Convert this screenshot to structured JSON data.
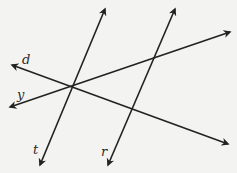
{
  "diagram": {
    "stroke_color": "#222222",
    "background_color": "#f3f3f1",
    "lines": [
      {
        "name": "t",
        "x1": 70,
        "y1": 86,
        "x2": 105,
        "y2": 9,
        "x3": 40,
        "y3": 165
      },
      {
        "name": "r",
        "x1": 143,
        "y1": 84,
        "x2": 175,
        "y2": 9,
        "x3": 108,
        "y3": 165
      },
      {
        "name": "y",
        "x1": 120,
        "y1": 70,
        "x2": 230,
        "y2": 32,
        "x3": 10,
        "y3": 107
      },
      {
        "name": "d",
        "x1": 120,
        "y1": 104,
        "x2": 228,
        "y2": 144,
        "x3": 12,
        "y3": 65
      }
    ],
    "labels": {
      "d": "d",
      "y": "y",
      "t": "t",
      "r": "r"
    }
  }
}
